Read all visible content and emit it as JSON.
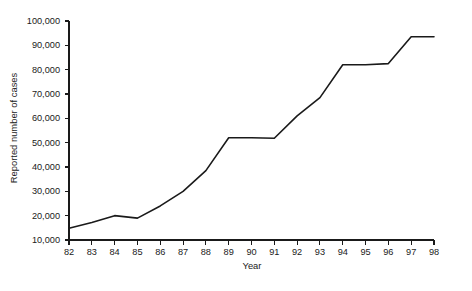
{
  "chart_data": {
    "type": "line",
    "title": "",
    "subtitle": "",
    "xlabel": "Year",
    "ylabel": "Reported number of cases",
    "categories": [
      "82",
      "83",
      "84",
      "85",
      "86",
      "87",
      "88",
      "89",
      "90",
      "91",
      "92",
      "93",
      "94",
      "95",
      "96",
      "97",
      "98"
    ],
    "x": [
      82,
      83,
      84,
      85,
      86,
      87,
      88,
      89,
      90,
      91,
      92,
      93,
      94,
      95,
      96,
      97,
      98
    ],
    "values": [
      14800,
      17200,
      20000,
      19000,
      24000,
      30000,
      38500,
      52000,
      52000,
      51800,
      61000,
      68500,
      82000,
      82000,
      82500,
      93500,
      93500
    ],
    "series": [
      {
        "name": "Reported number of cases",
        "values": [
          14800,
          17200,
          20000,
          19000,
          24000,
          30000,
          38500,
          52000,
          52000,
          51800,
          61000,
          68500,
          82000,
          82000,
          82500,
          93500,
          93500
        ]
      }
    ],
    "xlim": [
      82,
      98
    ],
    "ylim": [
      10000,
      100000
    ],
    "ytick_values": [
      10000,
      20000,
      30000,
      40000,
      50000,
      60000,
      70000,
      80000,
      90000,
      100000
    ],
    "ytick_labels": [
      "10,000",
      "20,000",
      "30,000",
      "40,000",
      "50,000",
      "60,000",
      "70,000",
      "80,000",
      "90,000",
      "100,000"
    ],
    "xtick_labels": [
      "82",
      "83",
      "84",
      "85",
      "86",
      "87",
      "88",
      "89",
      "90",
      "91",
      "92",
      "93",
      "94",
      "95",
      "96",
      "97",
      "98"
    ],
    "grid": false,
    "legend": false,
    "legend_position": "none",
    "line_color": "#1a1a1a",
    "background_color": "#ffffff",
    "axis_color": "#1a1a1a"
  }
}
